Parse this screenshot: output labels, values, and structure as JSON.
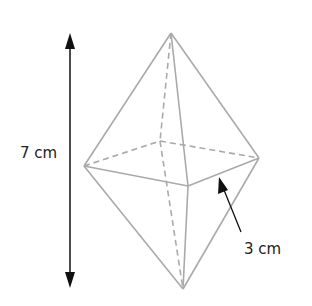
{
  "diagram": {
    "shape": "square bipyramid (octahedron-like)",
    "height_label": "7 cm",
    "edge_label": "3 cm",
    "colors": {
      "edges": "#aaaaaa",
      "arrows": "#111111",
      "text": "#222222"
    }
  }
}
